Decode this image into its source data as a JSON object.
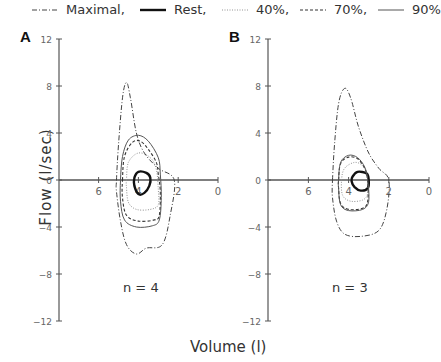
{
  "legend": {
    "items": [
      {
        "label": "Maximal,",
        "style": "dashdot",
        "x": 30
      },
      {
        "label": "Rest,",
        "style": "thick",
        "x": 138
      },
      {
        "label": "40%,",
        "style": "dotted",
        "x": 220
      },
      {
        "label": "70%,",
        "style": "dashed",
        "x": 298
      },
      {
        "label": "90%",
        "style": "thin",
        "x": 376
      }
    ]
  },
  "axis_labels": {
    "y": "Flow  (l/sec)",
    "x": "Volume  (l)"
  },
  "panels": [
    {
      "letter": "A",
      "n_label": "n = 4"
    },
    {
      "letter": "B",
      "n_label": "n = 3"
    }
  ],
  "chart_data": [
    {
      "type": "line",
      "title": "A",
      "annotation": "n = 4",
      "xlabel": "Volume (l)",
      "ylabel": "Flow (l/sec)",
      "xlim": [
        8,
        0
      ],
      "ylim": [
        -12,
        12
      ],
      "xticks": [
        6,
        4,
        2,
        0
      ],
      "yticks": [
        12,
        8,
        4,
        0,
        -4,
        -8,
        -12
      ],
      "series": [
        {
          "name": "Maximal",
          "style": "dashdot",
          "points": [
            [
              5.1,
              0
            ],
            [
              5.0,
              3
            ],
            [
              4.8,
              7
            ],
            [
              4.6,
              8.3
            ],
            [
              4.4,
              7
            ],
            [
              4.1,
              4
            ],
            [
              3.7,
              2.3
            ],
            [
              3.0,
              1.0
            ],
            [
              2.2,
              0
            ],
            [
              2.4,
              -3
            ],
            [
              2.8,
              -5.5
            ],
            [
              3.6,
              -5.8
            ],
            [
              4.1,
              -6.3
            ],
            [
              4.6,
              -5.5
            ],
            [
              4.9,
              -3.5
            ],
            [
              5.1,
              -1
            ]
          ]
        },
        {
          "name": "Rest",
          "style": "thick",
          "points": [
            [
              4.2,
              0.2
            ],
            [
              4.0,
              0.7
            ],
            [
              3.6,
              0.6
            ],
            [
              3.4,
              0.2
            ],
            [
              3.45,
              -0.5
            ],
            [
              3.7,
              -1.1
            ],
            [
              4.0,
              -1.2
            ],
            [
              4.2,
              -0.5
            ]
          ]
        },
        {
          "name": "40%",
          "style": "dotted",
          "points": [
            [
              4.6,
              0
            ],
            [
              4.5,
              1.5
            ],
            [
              4.0,
              2.3
            ],
            [
              3.4,
              1.9
            ],
            [
              3.1,
              0.9
            ],
            [
              3.0,
              -0.8
            ],
            [
              3.0,
              -2.1
            ],
            [
              3.4,
              -2.5
            ],
            [
              4.1,
              -2.5
            ],
            [
              4.5,
              -1.9
            ],
            [
              4.6,
              -0.6
            ]
          ]
        },
        {
          "name": "70%",
          "style": "dashed",
          "points": [
            [
              4.8,
              0
            ],
            [
              4.7,
              2
            ],
            [
              4.3,
              3.2
            ],
            [
              3.9,
              3.3
            ],
            [
              3.5,
              2.6
            ],
            [
              3.1,
              1.5
            ],
            [
              3.0,
              0.5
            ],
            [
              2.9,
              -1
            ],
            [
              2.95,
              -3.0
            ],
            [
              3.2,
              -3.4
            ],
            [
              4.0,
              -3.5
            ],
            [
              4.6,
              -3.0
            ],
            [
              4.8,
              -1.5
            ]
          ]
        },
        {
          "name": "90%",
          "style": "thin",
          "points": [
            [
              4.9,
              0
            ],
            [
              4.8,
              2
            ],
            [
              4.5,
              3.4
            ],
            [
              4.0,
              3.8
            ],
            [
              3.5,
              3.3
            ],
            [
              3.0,
              1.9
            ],
            [
              2.9,
              0.5
            ],
            [
              2.85,
              -1.5
            ],
            [
              2.95,
              -3.4
            ],
            [
              3.3,
              -3.9
            ],
            [
              4.1,
              -4.0
            ],
            [
              4.7,
              -3.4
            ],
            [
              4.9,
              -1.8
            ]
          ]
        }
      ]
    },
    {
      "type": "line",
      "title": "B",
      "annotation": "n = 3",
      "xlabel": "Volume (l)",
      "ylabel": "Flow (l/sec)",
      "xlim": [
        8,
        0
      ],
      "ylim": [
        -12,
        12
      ],
      "xticks": [
        6,
        4,
        2,
        0
      ],
      "yticks": [
        12,
        8,
        4,
        0,
        -4,
        -8,
        -12
      ],
      "series": [
        {
          "name": "Maximal",
          "style": "dashdot",
          "points": [
            [
              4.8,
              0
            ],
            [
              4.7,
              3
            ],
            [
              4.5,
              6.5
            ],
            [
              4.2,
              7.8
            ],
            [
              3.9,
              7.0
            ],
            [
              3.5,
              4.5
            ],
            [
              3.0,
              2.3
            ],
            [
              2.5,
              1.0
            ],
            [
              2.0,
              0
            ],
            [
              2.1,
              -2.5
            ],
            [
              2.5,
              -4.3
            ],
            [
              3.4,
              -4.8
            ],
            [
              4.2,
              -4.6
            ],
            [
              4.6,
              -3.5
            ],
            [
              4.8,
              -1.5
            ]
          ]
        },
        {
          "name": "Rest",
          "style": "thick",
          "points": [
            [
              3.8,
              0.3
            ],
            [
              3.55,
              0.7
            ],
            [
              3.1,
              0.55
            ],
            [
              3.0,
              0
            ],
            [
              3.05,
              -0.7
            ],
            [
              3.4,
              -0.9
            ],
            [
              3.7,
              -0.6
            ],
            [
              3.85,
              -0.1
            ]
          ]
        },
        {
          "name": "40%",
          "style": "dotted",
          "points": [
            [
              4.35,
              0
            ],
            [
              4.2,
              1.0
            ],
            [
              3.7,
              1.5
            ],
            [
              3.3,
              1.2
            ],
            [
              3.1,
              0.4
            ],
            [
              3.05,
              -1.1
            ],
            [
              3.3,
              -1.7
            ],
            [
              3.9,
              -1.8
            ],
            [
              4.3,
              -1.3
            ]
          ]
        },
        {
          "name": "70%",
          "style": "dashed",
          "points": [
            [
              4.5,
              0
            ],
            [
              4.4,
              1.4
            ],
            [
              4.0,
              1.95
            ],
            [
              3.55,
              1.8
            ],
            [
              3.2,
              1.0
            ],
            [
              3.05,
              0
            ],
            [
              3.05,
              -1.8
            ],
            [
              3.3,
              -2.4
            ],
            [
              4.0,
              -2.5
            ],
            [
              4.4,
              -2.0
            ],
            [
              4.5,
              -0.7
            ]
          ]
        },
        {
          "name": "90%",
          "style": "thin",
          "points": [
            [
              4.5,
              0
            ],
            [
              4.4,
              1.5
            ],
            [
              4.0,
              2.1
            ],
            [
              3.55,
              1.9
            ],
            [
              3.2,
              1.1
            ],
            [
              3.05,
              0
            ],
            [
              3.0,
              -1.8
            ],
            [
              3.3,
              -2.5
            ],
            [
              4.0,
              -2.6
            ],
            [
              4.4,
              -2.1
            ],
            [
              4.5,
              -0.7
            ]
          ]
        }
      ]
    }
  ]
}
